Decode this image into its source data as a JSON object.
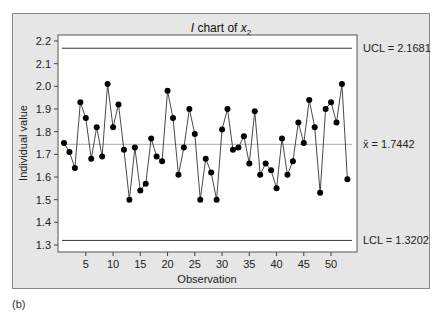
{
  "chart_data": {
    "type": "line",
    "title": "I chart of x2",
    "title_parts": {
      "italic": "I",
      "mid": " chart of ",
      "var": "x",
      "sub": "2"
    },
    "xlabel": "Observation",
    "ylabel": "Individual value",
    "x": [
      1,
      2,
      3,
      4,
      5,
      6,
      7,
      8,
      9,
      10,
      11,
      12,
      13,
      14,
      15,
      16,
      17,
      18,
      19,
      20,
      21,
      22,
      23,
      24,
      25,
      26,
      27,
      28,
      29,
      30,
      31,
      32,
      33,
      34,
      35,
      36,
      37,
      38,
      39,
      40,
      41,
      42,
      43,
      44,
      45,
      46,
      47,
      48,
      49,
      50,
      51,
      52,
      53
    ],
    "series": [
      {
        "name": "Individual value",
        "values": [
          1.75,
          1.71,
          1.64,
          1.93,
          1.86,
          1.68,
          1.82,
          1.69,
          2.01,
          1.82,
          1.92,
          1.72,
          1.5,
          1.73,
          1.54,
          1.57,
          1.77,
          1.69,
          1.67,
          1.98,
          1.86,
          1.61,
          1.73,
          1.9,
          1.79,
          1.5,
          1.68,
          1.62,
          1.5,
          1.81,
          1.9,
          1.72,
          1.73,
          1.78,
          1.66,
          1.89,
          1.61,
          1.66,
          1.63,
          1.55,
          1.77,
          1.61,
          1.67,
          1.84,
          1.75,
          1.94,
          1.82,
          1.53,
          1.9,
          1.93,
          1.84,
          2.01,
          1.59
        ]
      }
    ],
    "xticks": [
      5,
      10,
      15,
      20,
      25,
      30,
      35,
      40,
      45,
      50
    ],
    "yticks": [
      1.3,
      1.4,
      1.5,
      1.6,
      1.7,
      1.8,
      1.9,
      2.0,
      2.1,
      2.2
    ],
    "ytick_labels": [
      "1.3",
      "1.4",
      "1.5",
      "1.6",
      "1.7",
      "1.8",
      "1.9",
      "2.0",
      "2.1",
      "2.2"
    ],
    "ylim": [
      1.27,
      2.23
    ],
    "xlim": [
      0,
      54
    ],
    "grid": false,
    "control_limits": {
      "UCL": 2.1681,
      "center": 1.7442,
      "LCL": 1.3202
    },
    "annotations": {
      "ucl": "UCL = 2.1681",
      "center": "x̄ = 1.7442",
      "lcl": "LCL = 1.3202"
    }
  },
  "panel_label": "(b)",
  "colors": {
    "background": "#e6e6e6",
    "plot": "#ffffff",
    "line": "#333333",
    "center": "#aaaaaa"
  }
}
